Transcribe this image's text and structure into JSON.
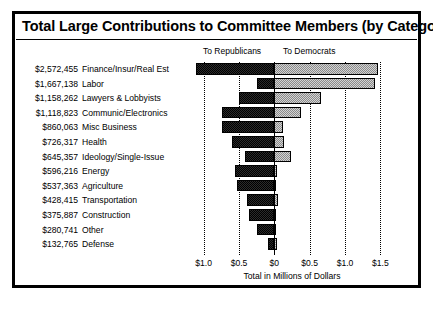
{
  "chart_data": {
    "type": "bar",
    "orientation": "horizontal",
    "stacked": "diverging",
    "title": "Total Large Contributions to Committee Members (by Category)",
    "xlabel": "Total in Millions of Dollars",
    "ylabel": "",
    "xlim": [
      -1.25,
      1.75
    ],
    "grid": true,
    "legend_position": "top",
    "xticks": [
      -1.0,
      -0.5,
      0,
      0.5,
      1.0,
      1.5
    ],
    "xticklabels": [
      "$1.0",
      "$0.5",
      "$0",
      "$0.5",
      "$1.0",
      "$1.5"
    ],
    "legend": [
      "To Republicans",
      "To Democrats"
    ],
    "categories": [
      "Finance/Insur/Real Est",
      "Labor",
      "Lawyers & Lobbyists",
      "Communic/Electronics",
      "Misc Business",
      "Health",
      "Ideology/Single-Issue",
      "Energy",
      "Agriculture",
      "Transportation",
      "Construction",
      "Other",
      "Defense"
    ],
    "totals_labels": [
      "$2,572,455",
      "$1,667,138",
      "$1,158,262",
      "$1,118,823",
      "$860,063",
      "$726,317",
      "$645,357",
      "$596,216",
      "$537,363",
      "$428,415",
      "$375,887",
      "$280,741",
      "$132,765"
    ],
    "totals_values": [
      2572455,
      1667138,
      1158262,
      1118823,
      860063,
      726317,
      645357,
      596216,
      537363,
      428415,
      375887,
      280741,
      132765
    ],
    "series": [
      {
        "name": "To Republicans",
        "values": [
          -1.11,
          -0.24,
          -0.5,
          -0.74,
          -0.74,
          -0.6,
          -0.41,
          -0.56,
          -0.53,
          -0.38,
          -0.36,
          -0.25,
          -0.09
        ]
      },
      {
        "name": "To Democrats",
        "values": [
          1.46,
          1.43,
          0.66,
          0.38,
          0.12,
          0.13,
          0.24,
          0.04,
          0.01,
          0.05,
          0.02,
          0.03,
          0.04
        ]
      }
    ]
  },
  "axis": {
    "title_text": "Total in Millions of Dollars"
  }
}
